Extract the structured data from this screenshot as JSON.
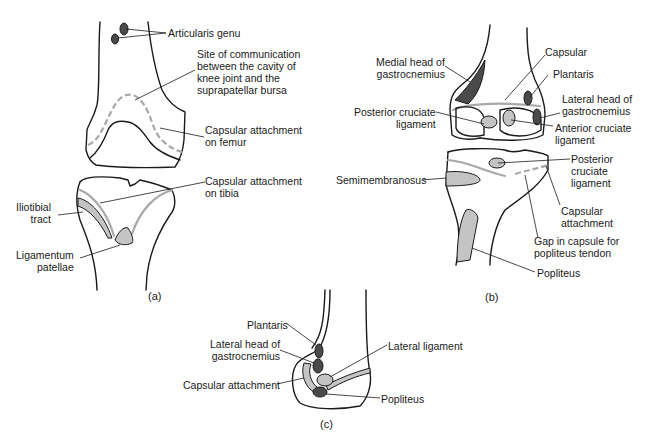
{
  "figure": {
    "panels": [
      {
        "id": "a",
        "caption": "(a)",
        "labels": {
          "articularis_genu": "Articularis genu",
          "site_of_communication": "Site of communication\nbetween the cavity of\nknee joint and the\nsuprapatellar bursa",
          "capsular_attachment_femur": "Capsular attachment\non femur",
          "capsular_attachment_tibia": "Capsular attachment\non tibia",
          "iliotibial_tract": "Iliotibial\ntract",
          "ligamentum_patellae": "Ligamentum\npatellae"
        }
      },
      {
        "id": "b",
        "caption": "(b)",
        "labels": {
          "medial_head_gastrocnemius": "Medial head of\ngastrocnemius",
          "capsular": "Capsular",
          "plantaris": "Plantaris",
          "lateral_head_gastrocnemius": "Lateral head of\ngastrocnemius",
          "posterior_cruciate_femur": "Posterior cruciate\nligament",
          "anterior_cruciate": "Anterior cruciate\nligament",
          "posterior_cruciate_tibia": "Posterior\ncruciate\nligament",
          "semimembranosus": "Semimembranosus",
          "capsular_attachment": "Capsular\nattachment",
          "gap_in_capsule": "Gap in capsule for\npopliteus tendon",
          "popliteus": "Popliteus"
        }
      },
      {
        "id": "c",
        "caption": "(c)",
        "labels": {
          "plantaris": "Plantaris",
          "lateral_head_gastrocnemius": "Lateral head of\ngastrocnemius",
          "lateral_ligament": "Lateral ligament",
          "capsular_attachment": "Capsular attachment",
          "popliteus": "Popliteus"
        }
      }
    ],
    "colors": {
      "outline": "#1a1a1a",
      "capsule_line": "#a8a8a8",
      "dark_fill": "#4a4a4a",
      "light_fill": "#c4c4c4"
    }
  }
}
